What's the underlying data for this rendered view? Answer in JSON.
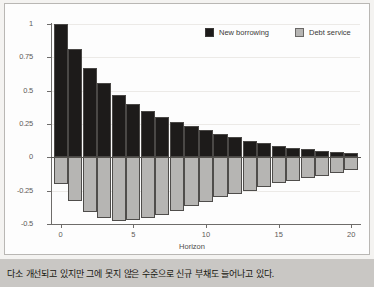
{
  "caption": {
    "text": "다소 개선되고 있지만 그에 못지 않은 수준으로 신규 부채도 늘어나고 있다."
  },
  "legend": {
    "items": [
      {
        "label": "New borrowing",
        "color": "#1d1b1a",
        "swatch": "black-square-icon"
      },
      {
        "label": "Debt service",
        "color": "#b6b5b3",
        "swatch": "gray-square-icon"
      }
    ]
  },
  "chart_data": {
    "type": "bar",
    "title": "",
    "xlabel": "Horizon",
    "ylabel": "",
    "xlim": [
      -0.6,
      20.6
    ],
    "ylim": [
      -0.5,
      1.0
    ],
    "xticks": [
      0,
      5,
      10,
      15,
      20
    ],
    "xtick_labels": [
      "0",
      "5",
      "10",
      "15",
      "20"
    ],
    "yticks": [
      1,
      0.75,
      0.5,
      0.25,
      0,
      -0.25,
      -0.5
    ],
    "ytick_labels": [
      "1",
      "0.75",
      "0.5",
      "0.25",
      "0",
      "-0.25",
      "-0.5"
    ],
    "grid": true,
    "legend_position": "top-right",
    "x": [
      0,
      1,
      2,
      3,
      4,
      5,
      6,
      7,
      8,
      9,
      10,
      11,
      12,
      13,
      14,
      15,
      16,
      17,
      18,
      19,
      20
    ],
    "series": [
      {
        "name": "New borrowing",
        "color": "#1d1b1a",
        "values": [
          1.0,
          0.81,
          0.67,
          0.56,
          0.47,
          0.4,
          0.345,
          0.3,
          0.265,
          0.235,
          0.205,
          0.175,
          0.15,
          0.125,
          0.105,
          0.085,
          0.07,
          0.06,
          0.05,
          0.04,
          0.03
        ]
      },
      {
        "name": "Debt service",
        "color": "#b6b5b3",
        "values": [
          -0.2,
          -0.33,
          -0.41,
          -0.455,
          -0.475,
          -0.47,
          -0.455,
          -0.43,
          -0.4,
          -0.365,
          -0.335,
          -0.3,
          -0.275,
          -0.25,
          -0.22,
          -0.195,
          -0.175,
          -0.155,
          -0.14,
          -0.12,
          -0.095
        ]
      }
    ]
  }
}
